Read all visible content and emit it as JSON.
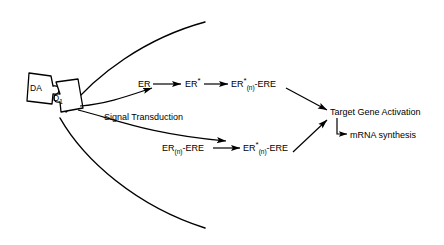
{
  "diagram": {
    "background_color": "#ffffff",
    "line_color": "#000000",
    "text_color": "#000000",
    "ligand": {
      "label": "DA",
      "name": "dopamine-ligand"
    },
    "receptor": {
      "label": "D",
      "subscript": "1",
      "name": "d1-receptor"
    },
    "pathway_label": "Signal Transduction",
    "top_pathway": {
      "step1": {
        "text": "ER"
      },
      "step2": {
        "text": "ER",
        "sup": "*"
      },
      "step3": {
        "text": "ER",
        "sup": "*",
        "sub": "(n)",
        "tail": "-ERE"
      }
    },
    "bottom_pathway": {
      "step1": {
        "text": "ER",
        "sub": "(n)",
        "tail": "-ERE"
      },
      "step2": {
        "text": "ER",
        "sup": "*",
        "sub": "(n)",
        "tail": "-ERE"
      }
    },
    "outcome": {
      "primary": "Target Gene Activation",
      "secondary": "mRNA synthesis"
    }
  }
}
